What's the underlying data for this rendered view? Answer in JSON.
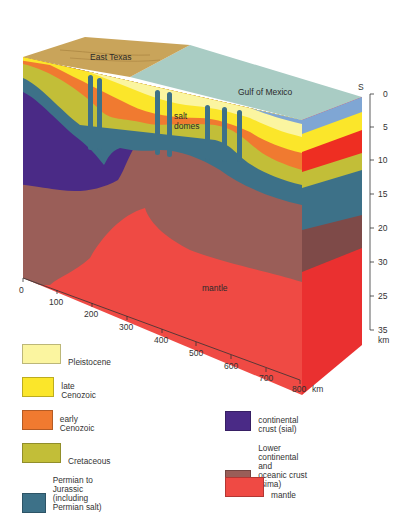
{
  "diagram": {
    "labels": {
      "east_texas": "East Texas",
      "gulf_of_mexico": "Gulf of Mexico",
      "salt_domes_line1": "salt",
      "salt_domes_line2": "domes",
      "mantle": "mantle",
      "compass": "S"
    },
    "depth_axis": {
      "unit": "km",
      "ticks": [
        "0",
        "5",
        "10",
        "15",
        "20",
        "30",
        "25",
        "35"
      ]
    },
    "distance_axis": {
      "unit": "km",
      "ticks": [
        "0",
        "100",
        "200",
        "300",
        "400",
        "500",
        "600",
        "700",
        "800"
      ]
    }
  },
  "legend": {
    "left": [
      {
        "label": "Pleistocene",
        "color": "#fbf5a0"
      },
      {
        "label": "late Cenozoic",
        "color": "#fbe62a"
      },
      {
        "label": "early Cenozoic",
        "color": "#f07a30"
      },
      {
        "label": "Cretaceous",
        "color": "#c2be38"
      },
      {
        "label": "Permian to Jurassic\n(including Permian salt)",
        "color": "#3d7188"
      }
    ],
    "right": [
      {
        "label": "continental crust (sial)",
        "color": "#4a2a86"
      },
      {
        "label": "Lower continental and\noceanic crust (sima)",
        "color": "#9a5e58"
      },
      {
        "label": "mantle",
        "color": "#ef4a44"
      }
    ]
  },
  "colors": {
    "land_top": "#c9a45a",
    "sea_top": "#a9ccc4",
    "sea_side": "#7fa6d4",
    "pleistocene": "#fbf5a0",
    "late_cenozoic": "#fbe62a",
    "early_cenozoic": "#f07a30",
    "early_cenozoic_side": "#ee2e22",
    "cretaceous": "#c2be38",
    "permian": "#3d7188",
    "sial": "#4a2a86",
    "sima": "#9a5e58",
    "sima_side": "#7e4a48",
    "mantle": "#ef4a44",
    "mantle_side": "#ea3030"
  }
}
